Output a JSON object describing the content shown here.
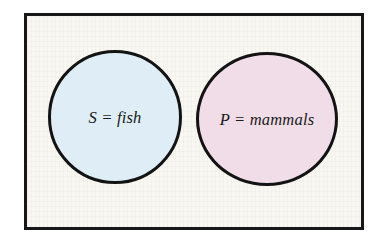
{
  "figure": {
    "type": "euler-diagram",
    "title_visible": false,
    "frame": {
      "background_color": "#f8f7f2",
      "border_color": "#171717",
      "outside_color": "#ffffff"
    },
    "relation": "disjoint",
    "sets": [
      {
        "id": "subject",
        "symbol": "S",
        "term": "fish",
        "label": "S = fish",
        "fill_color": "#dfeef6",
        "stroke_color": "#131313",
        "position": "left"
      },
      {
        "id": "predicate",
        "symbol": "P",
        "term": "mammals",
        "label": "P = mammals",
        "fill_color": "#f0dde8",
        "stroke_color": "#131313",
        "position": "right"
      }
    ]
  }
}
